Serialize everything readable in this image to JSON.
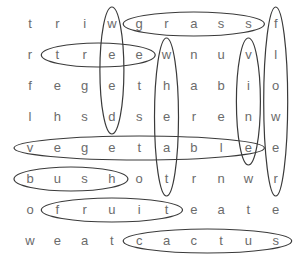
{
  "puzzle": {
    "title": "",
    "grid": [
      [
        "t",
        "r",
        "i",
        "w",
        "g",
        "r",
        "a",
        "s",
        "s",
        "f"
      ],
      [
        "r",
        "t",
        "r",
        "e",
        "e",
        "w",
        "n",
        "u",
        "v",
        "l"
      ],
      [
        "f",
        "e",
        "g",
        "e",
        "t",
        "h",
        "a",
        "b",
        "i",
        "o"
      ],
      [
        "l",
        "h",
        "s",
        "d",
        "s",
        "e",
        "r",
        "e",
        "n",
        "w"
      ],
      [
        "v",
        "e",
        "g",
        "e",
        "t",
        "a",
        "b",
        "l",
        "e",
        "e"
      ],
      [
        "b",
        "u",
        "s",
        "h",
        "o",
        "t",
        "r",
        "n",
        "w",
        "r"
      ],
      [
        "o",
        "f",
        "r",
        "u",
        "i",
        "t",
        "e",
        "a",
        "t",
        "e"
      ],
      [
        "w",
        "e",
        "a",
        "t",
        "c",
        "a",
        "c",
        "t",
        "u",
        "s"
      ]
    ],
    "found_words": [
      {
        "word": "grass",
        "direction": "horizontal",
        "row": 0,
        "start_col": 4,
        "end_col": 8
      },
      {
        "word": "tree",
        "direction": "horizontal",
        "row": 1,
        "start_col": 1,
        "end_col": 4
      },
      {
        "word": "weed",
        "direction": "vertical",
        "col": 3,
        "start_row": 0,
        "end_row": 3
      },
      {
        "word": "wheat",
        "direction": "vertical",
        "col": 5,
        "start_row": 1,
        "end_row": 5
      },
      {
        "word": "vine",
        "direction": "vertical",
        "col": 8,
        "start_row": 1,
        "end_row": 4
      },
      {
        "word": "flower",
        "direction": "vertical",
        "col": 9,
        "start_row": 0,
        "end_row": 5
      },
      {
        "word": "vegetable",
        "direction": "horizontal",
        "row": 4,
        "start_col": 0,
        "end_col": 8
      },
      {
        "word": "bush",
        "direction": "horizontal",
        "row": 5,
        "start_col": 0,
        "end_col": 3
      },
      {
        "word": "fruit",
        "direction": "horizontal",
        "row": 6,
        "start_col": 1,
        "end_col": 5
      },
      {
        "word": "cactus",
        "direction": "horizontal",
        "row": 7,
        "start_col": 4,
        "end_col": 9
      }
    ],
    "colors": {
      "letter": "#6b6b6b",
      "loop_stroke": "#3a3a3a",
      "background": "#ffffff"
    }
  }
}
